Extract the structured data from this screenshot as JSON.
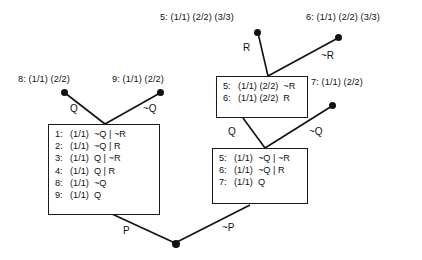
{
  "figure": {
    "branch_labels": {
      "p": "P",
      "not_p": "~P",
      "q": "Q",
      "not_q": "~Q",
      "r": "R",
      "not_r": "~R"
    },
    "leaf_nodes": [
      {
        "id": "leaf-8",
        "label": "8: (1/1)  (2/2)",
        "x": 18,
        "y": 80
      },
      {
        "id": "leaf-9",
        "label": "9: (1/1)  (2/2)",
        "x": 112,
        "y": 80
      },
      {
        "id": "leaf-5-top",
        "label": "5: (1/1) (2/2) (3/3)",
        "x": 163,
        "y": 14
      },
      {
        "id": "leaf-6-top",
        "label": "6: (1/1) (2/2) (3/3)",
        "x": 309,
        "y": 14
      },
      {
        "id": "leaf-7",
        "label": "7: (1/1)  (2/2)",
        "x": 311,
        "y": 82
      }
    ],
    "boxes": [
      {
        "id": "box-left",
        "rows": [
          {
            "index": "1:",
            "support": "(1/1)",
            "literals": "~Q | ~R"
          },
          {
            "index": "2:",
            "support": "(1/1)",
            "literals": "~Q | R"
          },
          {
            "index": "3:",
            "support": "(1/1)",
            "literals": "Q | ~R"
          },
          {
            "index": "4:",
            "support": "(1/1)",
            "literals": "Q | R"
          },
          {
            "index": "8:",
            "support": "(1/1)",
            "literals": "~Q"
          },
          {
            "index": "9:",
            "support": "(1/1)",
            "literals": "Q"
          }
        ]
      },
      {
        "id": "box-upper-right",
        "rows": [
          {
            "index": "5:",
            "support": "(1/1) (2/2)",
            "literals": "~R"
          },
          {
            "index": "6:",
            "support": "(1/1) (2/2)",
            "literals": "R"
          }
        ]
      },
      {
        "id": "box-lower-right",
        "rows": [
          {
            "index": "5:",
            "support": "(1/1)",
            "literals": "~Q | ~R"
          },
          {
            "index": "6:",
            "support": "(1/1)",
            "literals": "~Q | R"
          },
          {
            "index": "7:",
            "support": "(1/1)",
            "literals": "Q"
          }
        ]
      }
    ],
    "edge_label_positions": [
      {
        "key": "q",
        "text": "Q",
        "x": 70,
        "y": 110
      },
      {
        "key": "not_q",
        "text": "~Q",
        "x": 143,
        "y": 110
      },
      {
        "key": "r",
        "text": "R",
        "x": 245,
        "y": 43
      },
      {
        "key": "not_r",
        "text": "~R",
        "x": 322,
        "y": 53
      },
      {
        "key": "q2",
        "text": "Q",
        "x": 228,
        "y": 130
      },
      {
        "key": "not_q2",
        "text": "~Q",
        "x": 310,
        "y": 130
      },
      {
        "key": "p",
        "text": "P",
        "x": 122,
        "y": 230
      },
      {
        "key": "not_p",
        "text": "~P",
        "x": 222,
        "y": 228
      }
    ],
    "colors": {
      "ink": "#111111",
      "box_border": "#1a1a1a",
      "background": "#ffffff"
    }
  }
}
